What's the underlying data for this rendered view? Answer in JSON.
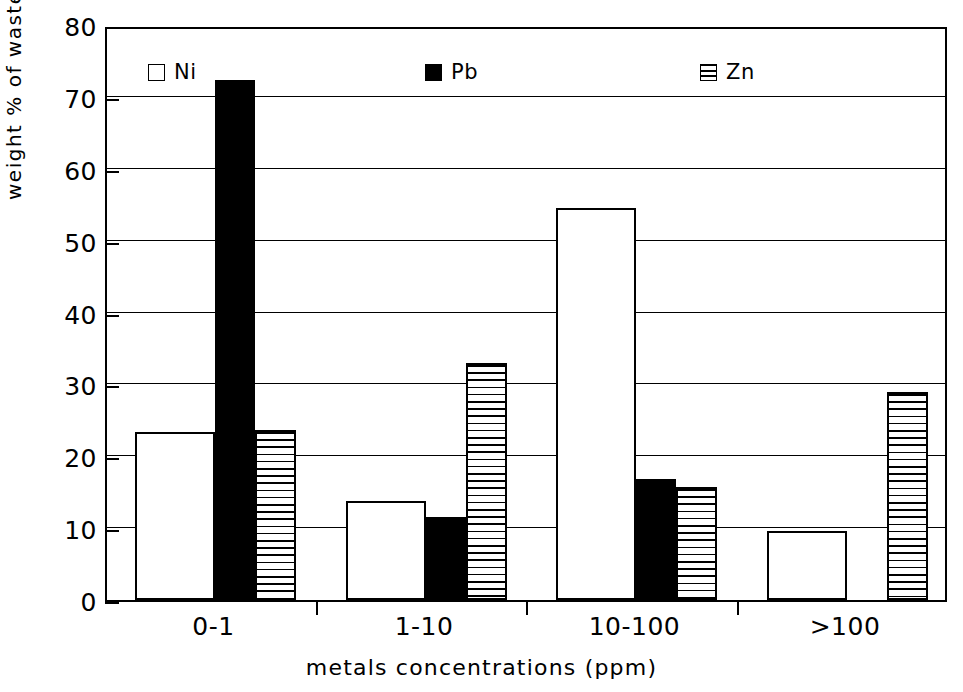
{
  "chart_data": {
    "type": "bar",
    "title": "",
    "xlabel": "metals concentrations (ppm)",
    "ylabel": "weight % of waste",
    "categories": [
      "0-1",
      "1-10",
      "10-100",
      ">100"
    ],
    "series": [
      {
        "name": "Ni",
        "pattern": "white",
        "values": [
          23.4,
          13.8,
          54.5,
          9.6
        ]
      },
      {
        "name": "Pb",
        "pattern": "black",
        "values": [
          72.4,
          11.5,
          16.9,
          0
        ]
      },
      {
        "name": "Zn",
        "pattern": "striped",
        "values": [
          23.7,
          33.0,
          15.7,
          29.0
        ]
      }
    ],
    "ylim": [
      0,
      80
    ],
    "yticks": [
      0,
      10,
      20,
      30,
      40,
      50,
      60,
      70,
      80
    ],
    "ytick_labels": [
      "0",
      "10",
      "20",
      "30",
      "40",
      "50",
      "60",
      "70",
      "80"
    ],
    "grid": true,
    "legend_position": "top-inside"
  },
  "legend": {
    "entries": [
      {
        "label": "Ni",
        "swatch": "white-square-icon"
      },
      {
        "label": "Pb",
        "swatch": "black-square-icon"
      },
      {
        "label": "Zn",
        "swatch": "striped-square-icon"
      }
    ]
  },
  "colors": {
    "axis": "#000000",
    "ni": "#ffffff",
    "pb": "#000000",
    "zn": "#ffffff",
    "background": "#ffffff"
  }
}
